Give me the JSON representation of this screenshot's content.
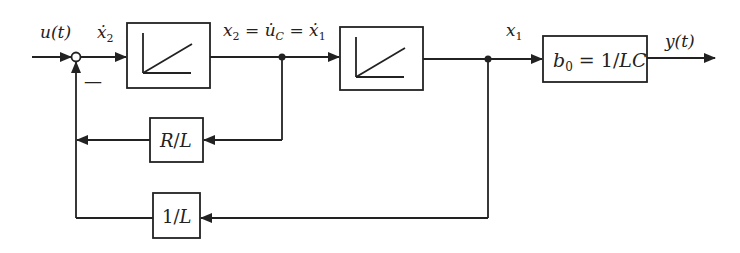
{
  "diagram": {
    "type": "block-diagram",
    "signals": {
      "input": "u(t)",
      "integrator1_input": "ẋ₂",
      "integrator1_output": "x₂ = u̇_C = ẋ₁",
      "integrator2_output": "x₁",
      "output": "y(t)",
      "summing_sign": "−"
    },
    "blocks": [
      {
        "id": "integrator-1",
        "kind": "integrator",
        "label": ""
      },
      {
        "id": "integrator-2",
        "kind": "integrator",
        "label": ""
      },
      {
        "id": "gain-b0",
        "kind": "gain",
        "label": "b₀ = 1/LC"
      },
      {
        "id": "gain-r-over-l",
        "kind": "gain",
        "label": "R/L"
      },
      {
        "id": "gain-1-over-l",
        "kind": "gain",
        "label": "1/L"
      }
    ],
    "labels": {
      "u": "u(t)",
      "x2dot": "ẋ",
      "x2dot_sub": "2",
      "x2": "x",
      "x2_sub": "2",
      "eq1": " = ",
      "uC": "u̇",
      "uC_sub": "C",
      "eq2": " = ",
      "x1dot": "ẋ",
      "x1dot_sub": "1",
      "x1": "x",
      "x1_sub": "1",
      "y": "y(t)",
      "minus": "—",
      "b0": "b",
      "b0_sub": "0",
      "b0_eq": " = 1/",
      "b0_lc": "LC",
      "rl_r": "R",
      "rl_slash": "/",
      "rl_l": "L",
      "one": "1",
      "one_slash": "/",
      "one_l": "L"
    },
    "colors": {
      "stroke": "#222222",
      "background": "#ffffff"
    }
  }
}
